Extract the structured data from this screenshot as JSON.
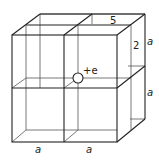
{
  "diagram": {
    "labels": {
      "top_depth": "5",
      "right_upper_inner": "2",
      "right_upper": "a",
      "right_lower": "a",
      "bottom_left": "a",
      "bottom_right": "a"
    },
    "charge": {
      "label": "+e"
    },
    "colors": {
      "line": "#222222",
      "background": "#ffffff"
    }
  }
}
